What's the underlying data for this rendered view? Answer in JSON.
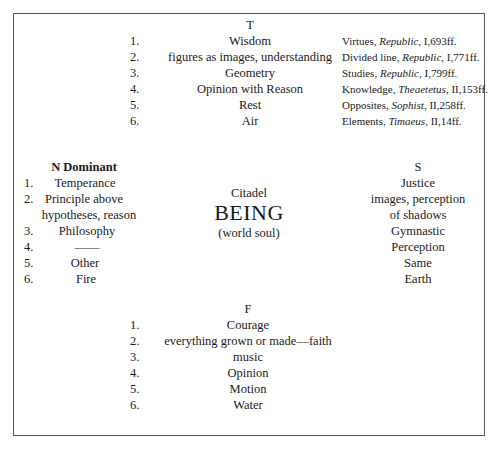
{
  "top": {
    "heading": "T",
    "items": [
      {
        "num": "1.",
        "label": "Wisdom",
        "ref_pre": "Virtues, ",
        "ref_work": "Republic",
        "ref_post": ", I,693ff."
      },
      {
        "num": "2.",
        "label": "figures as images, understanding",
        "ref_pre": "Divided line, ",
        "ref_work": "Republic",
        "ref_post": ", I,771ff."
      },
      {
        "num": "3.",
        "label": "Geometry",
        "ref_pre": "Studies, ",
        "ref_work": "Republic",
        "ref_post": ", I,799ff."
      },
      {
        "num": "4.",
        "label": "Opinion with Reason",
        "ref_pre": "Knowledge, ",
        "ref_work": "Theaetetus",
        "ref_post": ", II,153ff."
      },
      {
        "num": "5.",
        "label": "Rest",
        "ref_pre": "Opposites, ",
        "ref_work": "Sophist",
        "ref_post": ", II,258ff."
      },
      {
        "num": "6.",
        "label": "Air",
        "ref_pre": "Elements, ",
        "ref_work": "Timaeus",
        "ref_post": ", II,14ff."
      }
    ]
  },
  "left": {
    "heading": "N Dominant",
    "items": [
      {
        "num": "1.",
        "label": "Temperance"
      },
      {
        "num": "2.",
        "label": "Principle above",
        "label2": "hypotheses, reason"
      },
      {
        "num": "3.",
        "label": "Philosophy"
      },
      {
        "num": "4.",
        "label": "——"
      },
      {
        "num": "5.",
        "label": "Other"
      },
      {
        "num": "6.",
        "label": "Fire"
      }
    ]
  },
  "center": {
    "line1": "Citadel",
    "line2": "BEING",
    "line3": "(world soul)"
  },
  "right": {
    "heading": "S",
    "items": [
      "Justice",
      "images, perception",
      "of shadows",
      "Gymnastic",
      "Perception",
      "Same",
      "Earth"
    ]
  },
  "bottom": {
    "heading": "F",
    "items": [
      {
        "num": "1.",
        "label": "Courage"
      },
      {
        "num": "2.",
        "label": "everything grown or made—faith"
      },
      {
        "num": "3.",
        "label": "music"
      },
      {
        "num": "4.",
        "label": "Opinion"
      },
      {
        "num": "5.",
        "label": "Motion"
      },
      {
        "num": "6.",
        "label": "Water"
      }
    ]
  }
}
